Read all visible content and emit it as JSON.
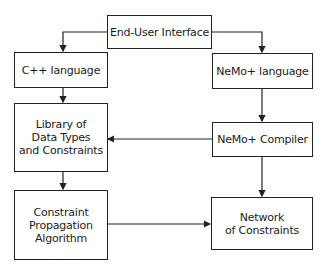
{
  "diagram": {
    "nodes": {
      "end_user_interface": {
        "lines": [
          "End-User Interface"
        ]
      },
      "cpp_language": {
        "lines": [
          "C++ language"
        ]
      },
      "nemo_language": {
        "lines": [
          "NeMo+ language"
        ]
      },
      "library": {
        "lines": [
          "Library of",
          "Data Types",
          "and Constraints"
        ]
      },
      "nemo_compiler": {
        "lines": [
          "NeMo+ Compiler"
        ]
      },
      "constraint_propagation": {
        "lines": [
          "Constraint",
          "Propagation",
          "Algorithm"
        ]
      },
      "network": {
        "lines": [
          "Network",
          "of Constraints"
        ]
      }
    },
    "edges": [
      {
        "from": "End-User Interface",
        "to": "C++ language"
      },
      {
        "from": "End-User Interface",
        "to": "NeMo+ language"
      },
      {
        "from": "C++ language",
        "to": "Library of Data Types and Constraints"
      },
      {
        "from": "NeMo+ language",
        "to": "NeMo+ Compiler"
      },
      {
        "from": "NeMo+ Compiler",
        "to": "Library of Data Types and Constraints"
      },
      {
        "from": "NeMo+ Compiler",
        "to": "Network of Constraints"
      },
      {
        "from": "Library of Data Types and Constraints",
        "to": "Constraint Propagation Algorithm"
      },
      {
        "from": "Constraint Propagation Algorithm",
        "to": "Network of Constraints"
      }
    ]
  }
}
